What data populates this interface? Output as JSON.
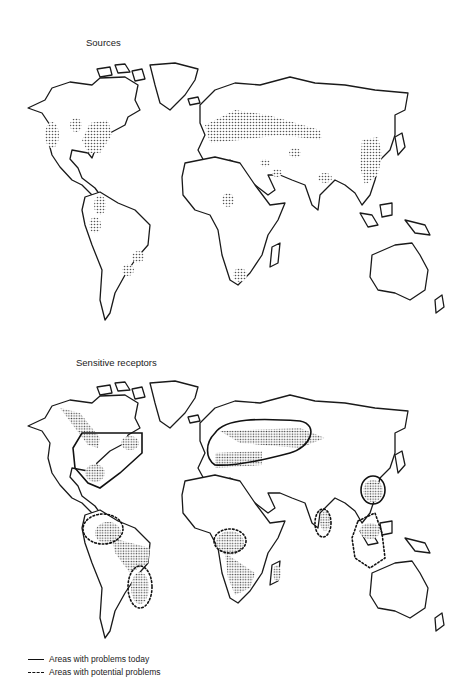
{
  "figure": {
    "panels": [
      {
        "title": "Sources",
        "regions_shaded": [
          "Western North America",
          "Eastern United States",
          "Northern South America",
          "Southeastern Brazil",
          "Europe",
          "Western Russia",
          "Middle East",
          "West Africa",
          "South Africa",
          "India",
          "Eastern China"
        ]
      },
      {
        "title": "Sensitive receptors",
        "outlines_today": [
          "Eastern North America",
          "Europe / Scandinavia / Western Russia",
          "Southern China"
        ],
        "outlines_potential": [
          "Northern South America",
          "Southeastern Brazil",
          "West/Central Africa",
          "Sri Lanka / Southern India",
          "Southeast Asia"
        ]
      }
    ],
    "legend": [
      {
        "style": "solid",
        "label": "Areas with problems today"
      },
      {
        "style": "dashed",
        "label": "Areas with potential problems"
      }
    ]
  }
}
